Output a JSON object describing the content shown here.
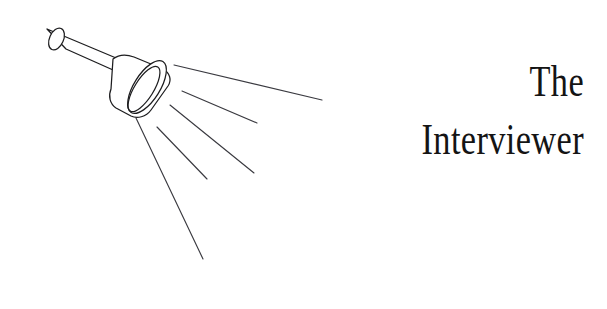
{
  "canvas": {
    "width": 607,
    "height": 309,
    "background_color": "#ffffff"
  },
  "title": {
    "line1": "The",
    "line2": "Interviewer",
    "alignment": "right",
    "color": "#141414"
  },
  "illustration": {
    "name": "flashlight-with-light-rays",
    "line_color": "#1d1d1f",
    "ray_color": "#3a3a40",
    "ray_count": 5,
    "parts": [
      "handle-cylinder",
      "handle-end-ellipse",
      "cone-head",
      "cone-rim-ellipse",
      "cone-inner-ellipse"
    ]
  }
}
